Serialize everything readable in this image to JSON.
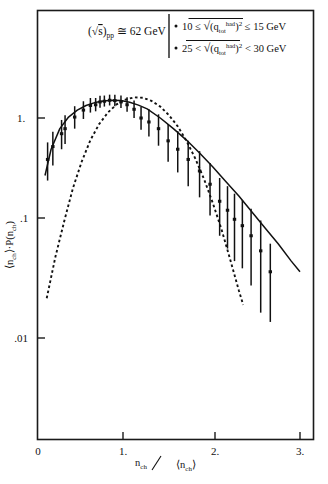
{
  "figure": {
    "kind": "scientific-plot",
    "background": "#ffffff",
    "ink": "#111111"
  },
  "legend": {
    "energy_label": "(√s)",
    "energy_sub": "pp",
    "energy_value": "≅ 62 GeV",
    "entries": [
      {
        "marker": "•",
        "left": "10 ≤",
        "radicand_base": "q",
        "radicand_sup": "had",
        "radicand_sub": "tot",
        "radicand_power": "2",
        "right": "≤  15 GeV"
      },
      {
        "marker": "•",
        "left": "25 <",
        "radicand_base": "q",
        "radicand_sup": "had",
        "radicand_sub": "tot",
        "radicand_power": "2",
        "right": "<  30 GeV"
      }
    ]
  },
  "axes": {
    "x": {
      "label_num": "n",
      "label_num_sub": "ch",
      "label_den": "⟨n",
      "label_den_sub": "ch",
      "label_den_close": "⟩",
      "label_text": "n_ch / ⟨n_ch⟩",
      "scale": "linear",
      "min": 0,
      "max": 3.25,
      "ticks": [
        {
          "value": 0,
          "label": "0"
        },
        {
          "value": 1,
          "label": "1."
        },
        {
          "value": 2,
          "label": "2."
        },
        {
          "value": 3,
          "label": "3."
        }
      ]
    },
    "y": {
      "label_text": "⟨n_ch⟩ · P(n_ch)",
      "label_a": "⟨n",
      "label_a_sub": "ch",
      "label_mid": "⟩·P(n",
      "label_b_sub": "ch",
      "label_close": ")",
      "scale": "log",
      "min": 0.0055,
      "max": 2.6,
      "ticks": [
        {
          "value": 1,
          "label": "1."
        },
        {
          "value": 0.1,
          "label": ".1"
        },
        {
          "value": 0.01,
          "label": ".01"
        }
      ]
    }
  },
  "chart_data": {
    "type": "scatter",
    "xlabel": "n_ch / ⟨n_ch⟩",
    "ylabel": "⟨n_ch⟩ · P(n_ch)",
    "xlim": [
      0,
      3.25
    ],
    "ylim": [
      0.0055,
      2.6
    ],
    "yscale": "log",
    "xscale": "linear",
    "grid": false,
    "legend_position": "top-inside-box",
    "series": [
      {
        "name": "data points with error bars",
        "style": "points-with-vertical-error-bars",
        "x": [
          0.11,
          0.17,
          0.27,
          0.31,
          0.42,
          0.52,
          0.6,
          0.66,
          0.71,
          0.76,
          0.82,
          0.88,
          0.95,
          1.02,
          1.1,
          1.18,
          1.27,
          1.38,
          1.49,
          1.6,
          1.72,
          1.85,
          1.97,
          2.08,
          2.17,
          2.25,
          2.34,
          2.44,
          2.55,
          2.66
        ],
        "y": [
          0.42,
          0.55,
          0.72,
          0.8,
          1.02,
          1.18,
          1.3,
          1.32,
          1.4,
          1.42,
          1.45,
          1.44,
          1.4,
          1.32,
          1.2,
          1.0,
          0.92,
          0.8,
          0.62,
          0.52,
          0.42,
          0.33,
          0.25,
          0.175,
          0.145,
          0.12,
          0.105,
          0.085,
          0.062,
          0.04
        ],
        "yerr_low": [
          0.15,
          0.18,
          0.2,
          0.22,
          0.22,
          0.2,
          0.18,
          0.17,
          0.16,
          0.15,
          0.15,
          0.16,
          0.17,
          0.18,
          0.2,
          0.22,
          0.24,
          0.24,
          0.22,
          0.2,
          0.18,
          0.14,
          0.12,
          0.09,
          0.08,
          0.07,
          0.062,
          0.055,
          0.045,
          0.026
        ],
        "yerr_high": [
          0.18,
          0.2,
          0.24,
          0.26,
          0.26,
          0.24,
          0.22,
          0.2,
          0.19,
          0.18,
          0.18,
          0.19,
          0.2,
          0.22,
          0.24,
          0.26,
          0.28,
          0.28,
          0.26,
          0.24,
          0.2,
          0.17,
          0.14,
          0.11,
          0.095,
          0.085,
          0.075,
          0.065,
          0.055,
          0.032
        ]
      },
      {
        "name": "solid fit curve",
        "style": "solid-line",
        "x": [
          0.08,
          0.15,
          0.25,
          0.35,
          0.45,
          0.55,
          0.65,
          0.75,
          0.85,
          0.95,
          1.05,
          1.15,
          1.25,
          1.4,
          1.55,
          1.7,
          1.85,
          2.0,
          2.15,
          2.3,
          2.45,
          2.6,
          2.75,
          2.9,
          3.0
        ],
        "y": [
          0.3,
          0.52,
          0.8,
          1.02,
          1.18,
          1.3,
          1.38,
          1.43,
          1.45,
          1.44,
          1.39,
          1.31,
          1.21,
          1.0,
          0.8,
          0.63,
          0.48,
          0.36,
          0.265,
          0.195,
          0.14,
          0.1,
          0.072,
          0.05,
          0.04
        ]
      },
      {
        "name": "dashed curve",
        "style": "dashed-line",
        "x": [
          0.1,
          0.2,
          0.3,
          0.4,
          0.5,
          0.6,
          0.7,
          0.8,
          0.9,
          1.0,
          1.1,
          1.2,
          1.3,
          1.4,
          1.5,
          1.6,
          1.7,
          1.8,
          1.9,
          2.0,
          2.1,
          2.2,
          2.3,
          2.35
        ],
        "y": [
          0.023,
          0.055,
          0.115,
          0.23,
          0.4,
          0.63,
          0.88,
          1.12,
          1.33,
          1.47,
          1.54,
          1.53,
          1.43,
          1.27,
          1.06,
          0.84,
          0.62,
          0.43,
          0.28,
          0.17,
          0.098,
          0.052,
          0.027,
          0.02
        ]
      }
    ]
  }
}
